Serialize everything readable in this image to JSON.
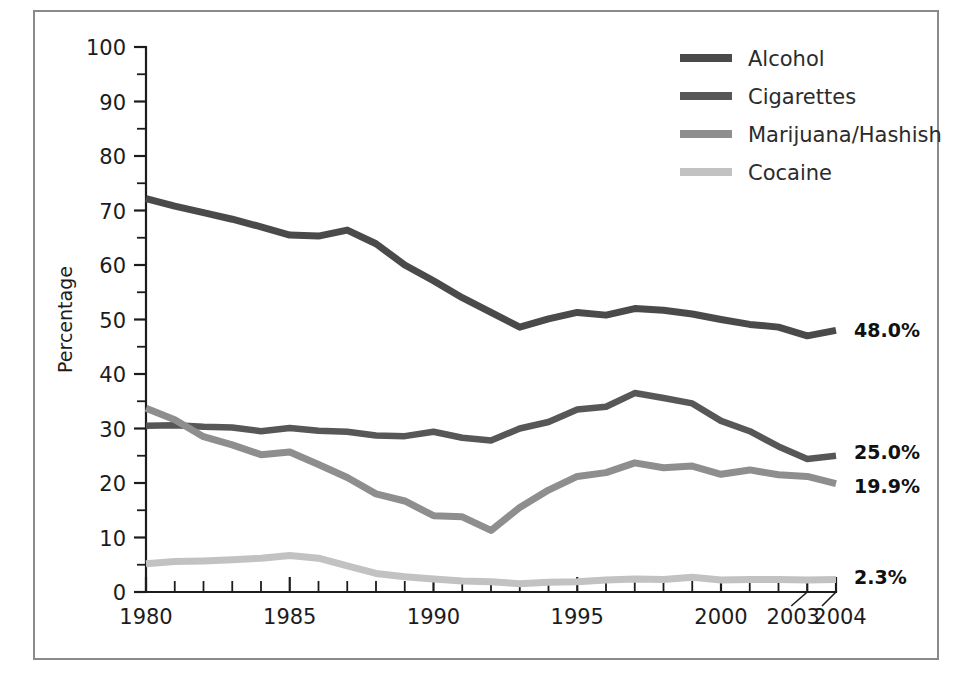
{
  "chart_data": {
    "type": "line",
    "title": "",
    "xlabel": "",
    "ylabel": "Percentage",
    "ylim": [
      0,
      100
    ],
    "xlim": [
      1980,
      2004
    ],
    "grid": false,
    "legend_position": "top-right",
    "y_ticks": [
      "0",
      "10",
      "20",
      "30",
      "40",
      "50",
      "60",
      "70",
      "80",
      "90",
      "100"
    ],
    "y_tick_values": [
      0,
      10,
      20,
      30,
      40,
      50,
      60,
      70,
      80,
      90,
      100
    ],
    "y_minor_step": 5,
    "x_ticks": [
      "1980",
      "1985",
      "1990",
      "1995",
      "2000",
      "2003",
      "2004"
    ],
    "x_tick_values": [
      1980,
      1985,
      1990,
      1995,
      2000,
      2003,
      2004
    ],
    "x": [
      1980,
      1981,
      1982,
      1983,
      1984,
      1985,
      1986,
      1987,
      1988,
      1989,
      1990,
      1991,
      1992,
      1993,
      1994,
      1995,
      1996,
      1997,
      1998,
      1999,
      2000,
      2001,
      2002,
      2003,
      2004
    ],
    "series": [
      {
        "name": "Alcohol",
        "color": "#4a4a4a",
        "end_label": "48.0%",
        "values": [
          72.2,
          70.8,
          69.6,
          68.4,
          67.0,
          65.5,
          65.3,
          66.4,
          63.9,
          60.0,
          57.1,
          54.0,
          51.3,
          48.6,
          50.1,
          51.3,
          50.8,
          52.0,
          51.7,
          51.0,
          50.0,
          49.1,
          48.6,
          47.0,
          48.0
        ]
      },
      {
        "name": "Cigarettes",
        "color": "#575757",
        "end_label": "25.0%",
        "values": [
          30.5,
          30.6,
          30.3,
          30.2,
          29.5,
          30.1,
          29.6,
          29.4,
          28.7,
          28.6,
          29.4,
          28.3,
          27.8,
          30.0,
          31.2,
          33.5,
          34.0,
          36.5,
          35.6,
          34.6,
          31.4,
          29.5,
          26.7,
          24.4,
          25.0
        ]
      },
      {
        "name": "Marijuana/Hashish",
        "color": "#8e8e8e",
        "end_label": "19.9%",
        "values": [
          33.7,
          31.6,
          28.5,
          27.0,
          25.2,
          25.7,
          23.4,
          21.0,
          18.0,
          16.7,
          14.0,
          13.8,
          11.3,
          15.5,
          18.7,
          21.2,
          21.9,
          23.7,
          22.8,
          23.1,
          21.6,
          22.4,
          21.5,
          21.2,
          19.9
        ]
      },
      {
        "name": "Cocaine",
        "color": "#c2c2c2",
        "end_label": "2.3%",
        "values": [
          5.2,
          5.6,
          5.7,
          5.9,
          6.2,
          6.7,
          6.2,
          4.8,
          3.4,
          2.8,
          2.4,
          2.0,
          1.9,
          1.5,
          1.8,
          1.9,
          2.2,
          2.4,
          2.3,
          2.7,
          2.2,
          2.3,
          2.3,
          2.2,
          2.3
        ]
      }
    ],
    "annotations": [
      {
        "text": "48.0%",
        "series": "Alcohol"
      },
      {
        "text": "25.0%",
        "series": "Cigarettes"
      },
      {
        "text": "19.9%",
        "series": "Marijuana/Hashish"
      },
      {
        "text": "2.3%",
        "series": "Cocaine"
      }
    ]
  },
  "legend": {
    "items": [
      {
        "label": "Alcohol",
        "color": "#4a4a4a"
      },
      {
        "label": "Cigarettes",
        "color": "#575757"
      },
      {
        "label": "Marijuana/Hashish",
        "color": "#8e8e8e"
      },
      {
        "label": "Cocaine",
        "color": "#c2c2c2"
      }
    ]
  },
  "axis": {
    "y_title": "Percentage"
  }
}
